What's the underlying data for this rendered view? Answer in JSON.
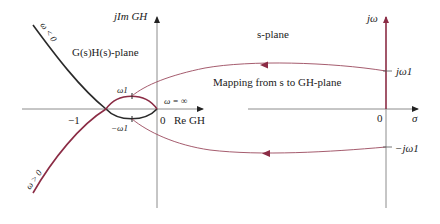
{
  "colors": {
    "axis": "#8c8c8c",
    "black_curve": "#2a2a2a",
    "maroon": "#8b2c45",
    "mapping": "#9b4a5e"
  },
  "gh_plane": {
    "title": "G(s)H(s)-plane",
    "imag_axis_label": "jIm GH",
    "real_axis_label": "Re GH",
    "tick_minus_one": "−1",
    "tick_zero": "0",
    "omega_neg_label": "ω < 0",
    "omega_pos_label": "ω > 0",
    "omega_inf_label": "ω = ∞",
    "omega1_label": "ω1",
    "neg_omega1_label": "−ω1"
  },
  "s_plane": {
    "title": "s-plane",
    "imag_axis_label": "jω",
    "real_axis_label": "σ",
    "tick_zero": "0",
    "j_omega1_label": "jω1",
    "neg_j_omega1_label": "−jω1"
  },
  "mapping": {
    "label": "Mapping from s to GH-plane"
  }
}
